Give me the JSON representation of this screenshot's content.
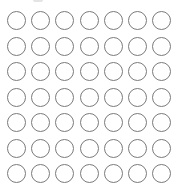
{
  "grid": {
    "rows": 7,
    "columns": 7,
    "cell_state": "empty",
    "stroke_color": "#7a7a7a",
    "fill_color": "#ffffff"
  }
}
